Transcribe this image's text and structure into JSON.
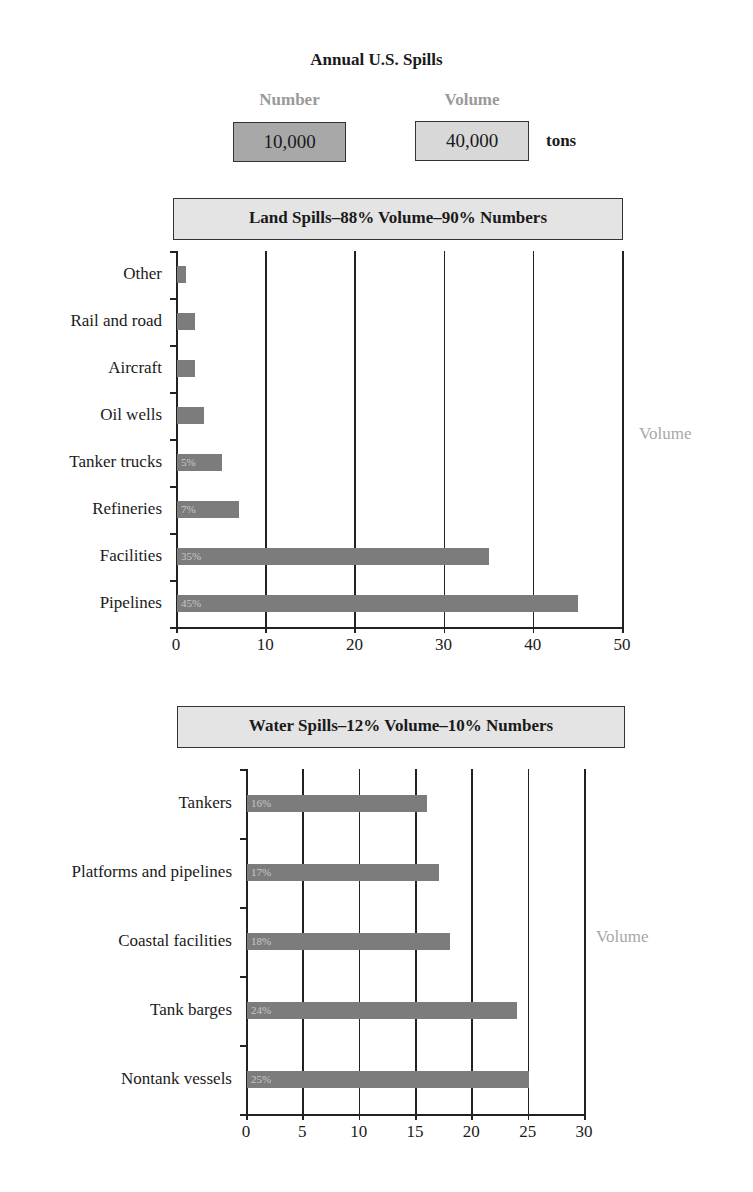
{
  "header": {
    "title": "Annual U.S. Spills",
    "legend": {
      "number_label": "Number",
      "number_value": "10,000",
      "volume_label": "Volume",
      "volume_value": "40,000",
      "unit": "tons"
    }
  },
  "colors": {
    "bar": "#7c7c7c",
    "number_box": "#a8a8a8",
    "volume_box": "#d8d8d8",
    "panel_header": "#e4e4e4",
    "muted_text": "#a8a8a8"
  },
  "chart_data": [
    {
      "type": "bar",
      "orientation": "horizontal",
      "title": "Land Spills–88% Volume–90% Numbers",
      "categories": [
        "Other",
        "Rail and road",
        "Aircraft",
        "Oil wells",
        "Tanker trucks",
        "Refineries",
        "Facilities",
        "Pipelines"
      ],
      "values": [
        1,
        2,
        2,
        3,
        5,
        7,
        35,
        45
      ],
      "bar_labels": [
        "",
        "",
        "",
        "",
        "5%",
        "7%",
        "35%",
        "45%"
      ],
      "xlabel": "",
      "ylabel": "",
      "side_label": "Volume",
      "xlim": [
        0,
        50
      ],
      "xticks": [
        0,
        10,
        20,
        30,
        40,
        50
      ],
      "grid": true
    },
    {
      "type": "bar",
      "orientation": "horizontal",
      "title": "Water Spills–12% Volume–10% Numbers",
      "categories": [
        "Tankers",
        "Platforms and pipelines",
        "Coastal facilities",
        "Tank barges",
        "Nontank vessels"
      ],
      "values": [
        16,
        17,
        18,
        24,
        25
      ],
      "bar_labels": [
        "16%",
        "17%",
        "18%",
        "24%",
        "25%"
      ],
      "xlabel": "",
      "ylabel": "",
      "side_label": "Volume",
      "xlim": [
        0,
        30
      ],
      "xticks": [
        0,
        5,
        10,
        15,
        20,
        25,
        30
      ],
      "grid": true
    }
  ]
}
